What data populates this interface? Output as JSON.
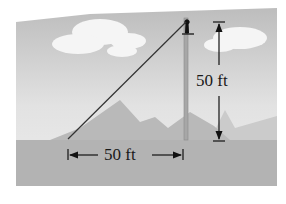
{
  "diagram": {
    "type": "right-triangle-word-problem",
    "vertical_label": "50 ft",
    "horizontal_label": "50 ft",
    "elements": [
      "sky",
      "clouds",
      "mountains",
      "ground",
      "pole",
      "guy-wire",
      "person-on-pole",
      "dimension-arrows"
    ],
    "colors": {
      "sky_top": "#bdbdbd",
      "sky_bottom": "#ececec",
      "mountain": "#b9b9b9",
      "mountain_light": "#c8c8c8",
      "ground": "#b3b3b3",
      "cloud": "#f4f4f4",
      "line": "#333333"
    }
  }
}
